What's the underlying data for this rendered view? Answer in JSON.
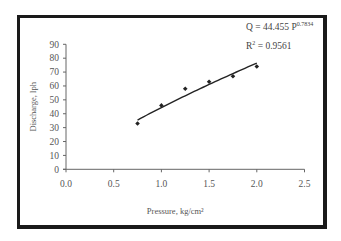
{
  "chart_data": {
    "type": "scatter",
    "title": "",
    "xlabel": "Pressure, kg/cm²",
    "ylabel": "Discharge, lph",
    "xlim": [
      0.0,
      2.5
    ],
    "ylim": [
      0,
      90
    ],
    "xticks": [
      "0.0",
      "0.5",
      "1.0",
      "1.5",
      "2.0",
      "2.5"
    ],
    "yticks": [
      "0",
      "10",
      "20",
      "30",
      "40",
      "50",
      "60",
      "70",
      "80",
      "90"
    ],
    "grid": false,
    "legend": null,
    "series": [
      {
        "name": "Observed discharge",
        "marker": "diamond",
        "x": [
          0.75,
          1.0,
          1.25,
          1.5,
          1.75,
          2.0
        ],
        "y": [
          33,
          46,
          58,
          63,
          67,
          74
        ]
      },
      {
        "name": "Power trendline",
        "type": "line",
        "equation": "Q = 44.455 P^0.7834",
        "coefficient": 44.455,
        "exponent": 0.7834,
        "x_range": [
          0.75,
          2.0
        ]
      }
    ],
    "annotations": {
      "equation_prefix": "Q = 44.455 P",
      "equation_exponent": "0.7834",
      "r2_prefix": "R",
      "r2_sup": "2",
      "r2_value": " = 0.9561"
    }
  }
}
